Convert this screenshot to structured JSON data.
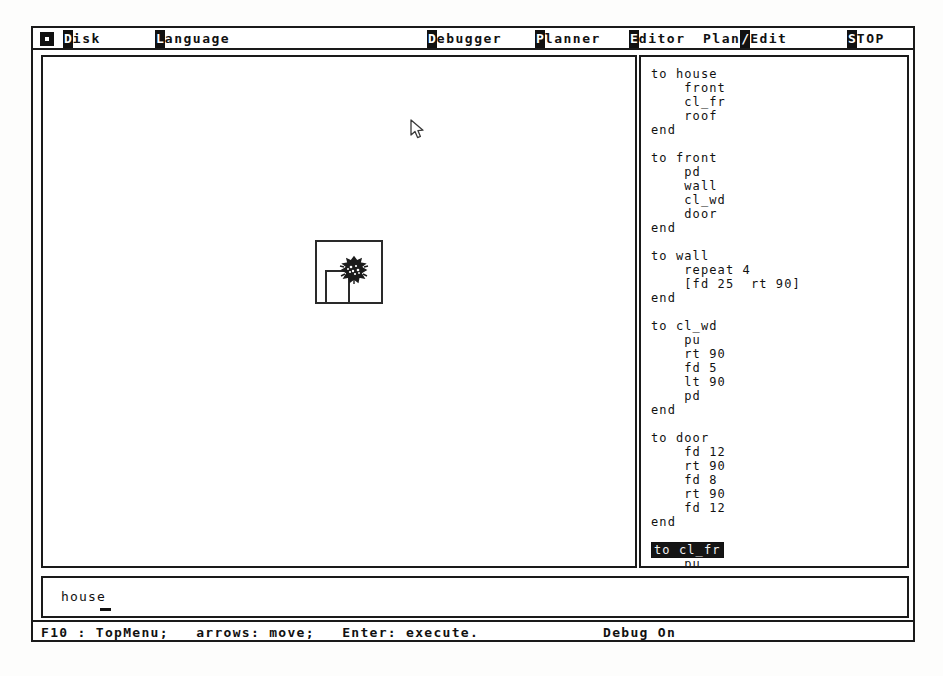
{
  "window": {
    "title": "Logo Programming Environment"
  },
  "menubar": {
    "system_icon": "system-menu-icon",
    "items": [
      {
        "label": "Disk",
        "hotkey": "D",
        "x": 30,
        "selected": false
      },
      {
        "label": "Language",
        "hotkey": "L",
        "x": 122,
        "selected": false
      },
      {
        "label": "Debugger",
        "hotkey": "D",
        "x": 394,
        "selected": false
      },
      {
        "label": "Planner",
        "hotkey": "P",
        "x": 502,
        "selected": false
      },
      {
        "label": "Editor",
        "hotkey": "E",
        "x": 596,
        "selected": false
      }
    ],
    "mode_switch": {
      "left_label": "Plan",
      "separator": "/",
      "right_label": "Edit",
      "x": 670
    },
    "stop": {
      "label": "STOP",
      "hotkey": "S",
      "x": 814
    }
  },
  "graphics": {
    "pane_name": "turtle-graphics-canvas",
    "shapes": [
      {
        "name": "house-wall-square",
        "kind": "square"
      },
      {
        "name": "house-door-rect",
        "kind": "rect"
      },
      {
        "name": "turtle-sprite",
        "kind": "blob"
      }
    ],
    "cursor": {
      "type": "arrow-pointer",
      "x": 400,
      "y": 97
    }
  },
  "code": {
    "pane_name": "procedure-editor",
    "selected_line_index": 34,
    "lines": [
      "to house",
      "    front",
      "    cl_fr",
      "    roof",
      "end",
      "",
      "to front",
      "    pd",
      "    wall",
      "    cl_wd",
      "    door",
      "end",
      "",
      "to wall",
      "    repeat 4",
      "    [fd 25  rt 90]",
      "end",
      "",
      "to cl_wd",
      "    pu",
      "    rt 90",
      "    fd 5",
      "    lt 90",
      "    pd",
      "end",
      "",
      "to door",
      "    fd 12",
      "    rt 90",
      "    fd 8",
      "    rt 90",
      "    fd 12",
      "end",
      "",
      "to cl_fr",
      "    pu",
      "    rt 90",
      "    fd 13",
      "    rt 90",
      "    fd 25",
      "    pd",
      "end"
    ]
  },
  "command": {
    "pane_name": "command-line",
    "value": "house",
    "placeholder": ""
  },
  "status": {
    "hints": "F10 : TopMenu;   arrows: move;   Enter: execute.",
    "debug": "Debug On"
  },
  "colors": {
    "ink": "#111111",
    "paper": "#ffffff",
    "highlight_bg": "#151515",
    "highlight_fg": "#f2f2f2"
  }
}
